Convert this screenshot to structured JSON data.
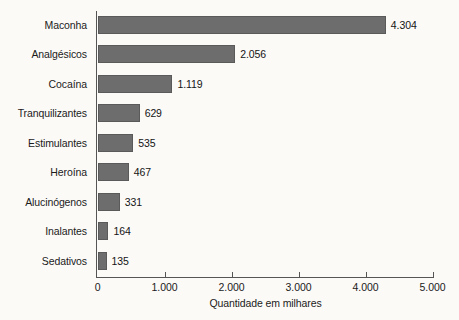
{
  "chart_data": {
    "type": "bar",
    "orientation": "horizontal",
    "title": "",
    "subtitle": "",
    "xlabel": "Quantidade em milhares",
    "ylabel": "",
    "categories": [
      "Maconha",
      "Analgésicos",
      "Cocaína",
      "Tranquilizantes",
      "Estimulantes",
      "Heroína",
      "Alucinógenos",
      "Inalantes",
      "Sedativos"
    ],
    "values": [
      4304,
      2056,
      1119,
      629,
      535,
      467,
      331,
      164,
      135
    ],
    "value_labels": [
      "4.304",
      "2.056",
      "1.119",
      "629",
      "535",
      "467",
      "331",
      "164",
      "135"
    ],
    "xlim": [
      0,
      5000
    ],
    "xticks": [
      0,
      1000,
      2000,
      3000,
      4000,
      5000
    ],
    "xtick_labels": [
      "0",
      "1.000",
      "2.000",
      "3.000",
      "4.000",
      "5.000"
    ],
    "grid": false,
    "legend": null,
    "bar_color": "#6d6d6d",
    "background_color": "#fbfaf7",
    "axis_color": "#555555",
    "text_color": "#1b1b1b"
  }
}
